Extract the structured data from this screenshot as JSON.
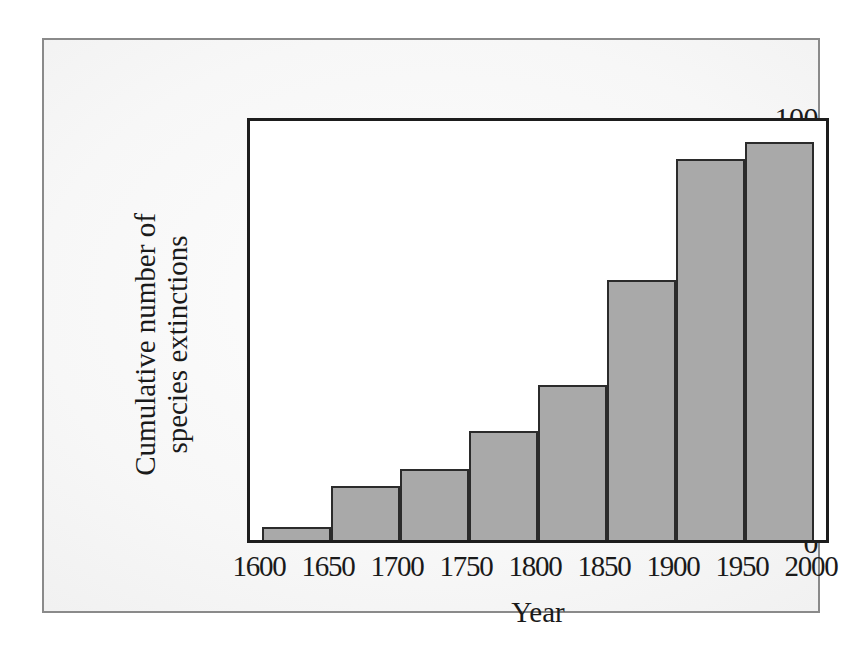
{
  "figure": {
    "frame_color": "#8a8a8a",
    "axis_color": "#1d1d1d",
    "bar_fill": "#a9a9a9",
    "bar_stroke": "#2b2b2b",
    "plot_background": "#ffffff"
  },
  "axes": {
    "x_title": "Year",
    "y_title_line1": "Cumulative number of",
    "y_title_line2": "species extinctions",
    "y_ticks": [
      "0",
      "20",
      "40",
      "60",
      "80",
      "100"
    ],
    "x_ticks": [
      "1600",
      "1650",
      "1700",
      "1750",
      "1800",
      "1850",
      "1900",
      "1950",
      "2000"
    ]
  },
  "chart_data": {
    "type": "bar",
    "title": "",
    "subtitle": "",
    "xlabel": "Year",
    "ylabel": "Cumulative number of species extinctions",
    "categories": [
      "1600-1650",
      "1650-1700",
      "1700-1750",
      "1750-1800",
      "1800-1850",
      "1850-1900",
      "1900-1950",
      "1950-2000"
    ],
    "bin_edges": [
      1600,
      1650,
      1700,
      1750,
      1800,
      1850,
      1900,
      1950,
      2000
    ],
    "values": [
      3,
      13,
      17,
      26,
      37,
      62,
      91,
      95
    ],
    "xlim": [
      1600,
      2000
    ],
    "ylim": [
      0,
      100
    ],
    "ytick_values": [
      0,
      20,
      40,
      60,
      80,
      100
    ],
    "xtick_values": [
      1600,
      1650,
      1700,
      1750,
      1800,
      1850,
      1900,
      1950,
      2000
    ],
    "grid": false,
    "legend": "none",
    "bar_style": "histogram-adjacent"
  }
}
